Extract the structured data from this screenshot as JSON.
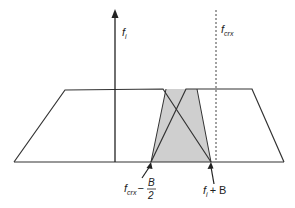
{
  "diagram": {
    "colors": {
      "line": "#333333",
      "shade": "#cfcfcf",
      "background": "#ffffff"
    },
    "labels": {
      "axis_label_main": "f",
      "axis_label_sub": "i",
      "dashed_label_main": "f",
      "dashed_label_sub": "crx",
      "lower_left_main": "f",
      "lower_left_sub": "crx",
      "lower_left_minus": "−",
      "lower_left_num": "B",
      "lower_left_den": "2",
      "lower_right_main": "f",
      "lower_right_sub": "i",
      "lower_right_plus": "+ B"
    },
    "shapes": {
      "left_trapezoid": "filter passband (left)",
      "right_trapezoid": "filter passband (right)",
      "overlap_region": "shaded overlap"
    }
  }
}
